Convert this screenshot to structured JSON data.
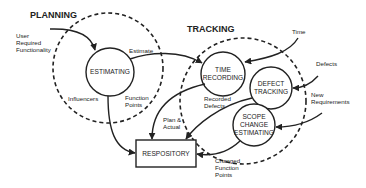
{
  "sections": {
    "planning": "PLANNING",
    "tracking": "TRACKING"
  },
  "nodes": {
    "estimating": "ESTIMATING",
    "time_recording": [
      "TIME",
      "RECORDING"
    ],
    "defect_tracking": [
      "DEFECT",
      "TRACKING"
    ],
    "scope_change": [
      "SCOPE",
      "CHANGE",
      "ESTIMATING"
    ],
    "repository": "RESPOSITORY"
  },
  "labels": {
    "user_required": [
      "User",
      "Required",
      "Functionality"
    ],
    "estimate": "Estimate",
    "influencers": "Influencers",
    "function_points": [
      "Function",
      "Points"
    ],
    "time": "Time",
    "defects": "Defects",
    "new_requirements": [
      "New",
      "Requirements"
    ],
    "recorded_defects": [
      "Recorded",
      "Defects"
    ],
    "plan_actual": [
      "Plan &",
      "Actual"
    ],
    "changed_function_points": [
      "Changed",
      "Function",
      "Points"
    ]
  }
}
